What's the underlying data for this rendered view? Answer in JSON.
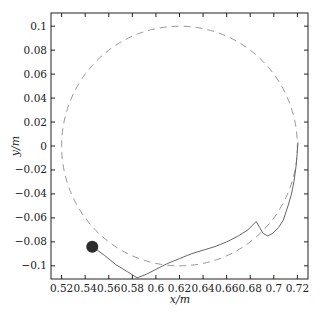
{
  "chart_data": {
    "type": "line",
    "title": "",
    "xlabel": "x/m",
    "ylabel": "y/m",
    "xlim": [
      0.511,
      0.729
    ],
    "ylim": [
      -0.111,
      0.111
    ],
    "grid": false,
    "legend": null,
    "xticks": [
      0.52,
      0.54,
      0.56,
      0.58,
      0.6,
      0.62,
      0.64,
      0.66,
      0.68,
      0.7,
      0.72
    ],
    "xtick_labels": [
      "0.52",
      "0.54",
      "0.56",
      "0.58",
      "0.6",
      "0.62",
      "0.64",
      "0.66",
      "0.68",
      "0.7",
      "0.72"
    ],
    "yticks": [
      0.1,
      0.08,
      0.06,
      0.04,
      0.02,
      0,
      -0.02,
      -0.04,
      -0.06,
      -0.08,
      -0.1
    ],
    "ytick_labels": [
      "0.1",
      "0.08",
      "0.06",
      "0.04",
      "0.02",
      "0",
      "−0.02",
      "−0.04",
      "−0.06",
      "−0.08",
      "−0.1"
    ],
    "series": [
      {
        "name": "reference circle",
        "style": "dashed",
        "color": "#999999",
        "shape": "circle",
        "center": [
          0.62,
          0.0
        ],
        "radius": 0.1
      },
      {
        "name": "trajectory",
        "style": "solid",
        "color": "#666666",
        "x": [
          0.546,
          0.556,
          0.566,
          0.576,
          0.584,
          0.592,
          0.6,
          0.61,
          0.62,
          0.63,
          0.64,
          0.65,
          0.66,
          0.67,
          0.678,
          0.685,
          0.688,
          0.691,
          0.695,
          0.699,
          0.704,
          0.708,
          0.712,
          0.715,
          0.717,
          0.719,
          0.72,
          0.7205
        ],
        "y": [
          -0.084,
          -0.091,
          -0.099,
          -0.105,
          -0.11,
          -0.107,
          -0.103,
          -0.098,
          -0.094,
          -0.09,
          -0.087,
          -0.084,
          -0.08,
          -0.075,
          -0.07,
          -0.063,
          -0.068,
          -0.073,
          -0.075,
          -0.073,
          -0.068,
          -0.062,
          -0.05,
          -0.04,
          -0.03,
          -0.016,
          -0.004,
          0.003
        ]
      },
      {
        "name": "start point",
        "style": "marker",
        "color": "#2b2b2b",
        "x": [
          0.546
        ],
        "y": [
          -0.084
        ]
      }
    ]
  }
}
